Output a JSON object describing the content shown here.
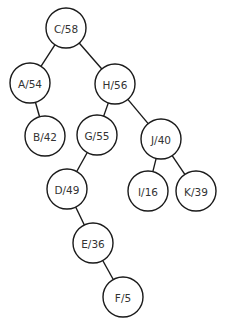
{
  "diagram": {
    "type": "binary-tree",
    "node_radius": 20,
    "colors": {
      "stroke": "#1a1a1a",
      "fill": "#ffffff",
      "text": "#333333",
      "background": "#ffffff"
    },
    "nodes": [
      {
        "id": "C",
        "label": "C/58",
        "key": "C",
        "value": 58,
        "x": 66,
        "y": 28
      },
      {
        "id": "A",
        "label": "A/54",
        "key": "A",
        "value": 54,
        "x": 30,
        "y": 83
      },
      {
        "id": "H",
        "label": "H/56",
        "key": "H",
        "value": 56,
        "x": 115,
        "y": 84
      },
      {
        "id": "B",
        "label": "B/42",
        "key": "B",
        "value": 42,
        "x": 45,
        "y": 136
      },
      {
        "id": "G",
        "label": "G/55",
        "key": "G",
        "value": 55,
        "x": 97,
        "y": 135
      },
      {
        "id": "J",
        "label": "J/40",
        "key": "J",
        "value": 40,
        "x": 161,
        "y": 139
      },
      {
        "id": "D",
        "label": "D/49",
        "key": "D",
        "value": 49,
        "x": 67,
        "y": 189
      },
      {
        "id": "I",
        "label": "I/16",
        "key": "I",
        "value": 16,
        "x": 148,
        "y": 191
      },
      {
        "id": "K",
        "label": "K/39",
        "key": "K",
        "value": 39,
        "x": 196,
        "y": 191
      },
      {
        "id": "E",
        "label": "E/36",
        "key": "E",
        "value": 36,
        "x": 93,
        "y": 243
      },
      {
        "id": "F",
        "label": "F/5",
        "key": "F",
        "value": 5,
        "x": 123,
        "y": 297
      }
    ],
    "edges": [
      {
        "from": "C",
        "to": "A"
      },
      {
        "from": "C",
        "to": "H"
      },
      {
        "from": "A",
        "to": "B"
      },
      {
        "from": "H",
        "to": "G"
      },
      {
        "from": "H",
        "to": "J"
      },
      {
        "from": "G",
        "to": "D"
      },
      {
        "from": "J",
        "to": "I"
      },
      {
        "from": "J",
        "to": "K"
      },
      {
        "from": "D",
        "to": "E"
      },
      {
        "from": "E",
        "to": "F"
      }
    ]
  }
}
